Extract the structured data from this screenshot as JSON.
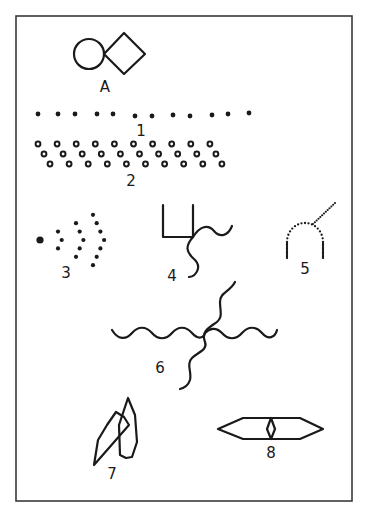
{
  "figure": {
    "labels": {
      "A": "A",
      "f1": "1",
      "f2": "2",
      "f3": "3",
      "f4": "4",
      "f5": "5",
      "f6": "6",
      "f7": "7",
      "f8": "8"
    },
    "descriptions": {
      "A": "circle adjoining a diamond",
      "f1": "single row of 12 dots",
      "f2": "three staggered rows of small rings (10 per row)",
      "f3": "single large dot followed by three concentric dotted arcs (3, 5, 7 dots)",
      "f4": "U-shaped bracket with two wavy lines from its lower-right corner",
      "f5": "dotted arch with a dotted diagonal line",
      "f6": "wavy cross: horizontal wave crossed by a diagonal wave",
      "f7": "two overlapping elongated polygons",
      "f8": "elongated hexagon with a small diamond at its center"
    },
    "counts": {
      "f1_dots": 12,
      "f2_rows": 3,
      "f2_rings_per_row": 10,
      "f3_arc_dots": [
        3,
        5,
        7
      ]
    },
    "colors": {
      "ink": "#1a1a1a",
      "frame": "#3a3a3a",
      "paper": "#ffffff"
    }
  }
}
